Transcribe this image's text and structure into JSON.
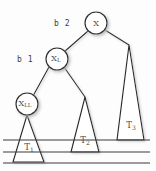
{
  "diagram": {
    "background_color": "#fdfdfd",
    "stroke_color": "#2b2b2b",
    "text_color": "#4a4a4a",
    "shadow_color": "#cfcfcf",
    "nodes": [
      {
        "id": "root",
        "label": "X",
        "subscript": "",
        "cx": 96,
        "cy": 23,
        "r": 11
      },
      {
        "id": "left",
        "label": "X",
        "subscript": "L",
        "cx": 57,
        "cy": 59,
        "r": 11
      },
      {
        "id": "leftleft",
        "label": "X",
        "subscript": "LL",
        "cx": 27,
        "cy": 104,
        "r": 11
      }
    ],
    "subtrees": [
      {
        "id": "t1",
        "label": "T",
        "subscript": "1",
        "apex_x": 27,
        "apex_y": 115,
        "base_left_x": 13,
        "base_left_y": 162,
        "base_right_x": 44,
        "base_right_y": 162,
        "text_x": 29,
        "text_y": 150
      },
      {
        "id": "t2",
        "label": "T",
        "subscript": "2",
        "apex_x": 85,
        "apex_y": 97,
        "base_left_x": 71,
        "base_left_y": 152,
        "base_right_x": 99,
        "base_right_y": 152,
        "text_x": 85,
        "text_y": 143
      },
      {
        "id": "t3",
        "label": "T",
        "subscript": "3",
        "apex_x": 129,
        "apex_y": 45,
        "base_left_x": 117,
        "base_left_y": 140,
        "base_right_x": 144,
        "base_right_y": 140,
        "text_x": 131,
        "text_y": 128
      }
    ],
    "edges": [
      {
        "id": "root-to-left",
        "x1": 88,
        "y1": 31,
        "x2": 64,
        "y2": 52
      },
      {
        "id": "root-to-t3",
        "x1": 105,
        "y1": 30,
        "x2": 129,
        "y2": 45
      },
      {
        "id": "left-to-leftleft",
        "x1": 49,
        "y1": 67,
        "x2": 33,
        "y2": 96
      },
      {
        "id": "left-to-t2",
        "x1": 64,
        "y1": 67,
        "x2": 85,
        "y2": 97
      }
    ],
    "height_lines": [
      {
        "id": "height-line-top",
        "x1": 3,
        "y1": 140,
        "x2": 150,
        "y2": 140
      },
      {
        "id": "height-line-middle",
        "x1": 3,
        "y1": 152,
        "x2": 150,
        "y2": 152
      },
      {
        "id": "height-line-bottom",
        "x1": 3,
        "y1": 163,
        "x2": 150,
        "y2": 163
      }
    ],
    "balance_labels": [
      {
        "id": "balance-root",
        "text": "b 2",
        "x": 62,
        "y": 23
      },
      {
        "id": "balance-left",
        "text": "b 1",
        "x": 25,
        "y": 59
      }
    ]
  }
}
